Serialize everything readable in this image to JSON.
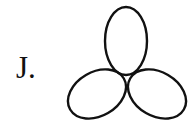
{
  "label": "J.",
  "figure": {
    "type": "three-ellipse trefoil",
    "stroke": "#111111",
    "fill": "none",
    "ellipses": [
      {
        "name": "top",
        "cx": 126,
        "cy": 41,
        "rx": 21,
        "ry": 34,
        "rotate": 0
      },
      {
        "name": "bottom-left",
        "cx": 97,
        "cy": 94,
        "rx": 31,
        "ry": 22,
        "rotate": -30
      },
      {
        "name": "bottom-right",
        "cx": 157,
        "cy": 94,
        "rx": 31,
        "ry": 22,
        "rotate": 30
      }
    ]
  }
}
